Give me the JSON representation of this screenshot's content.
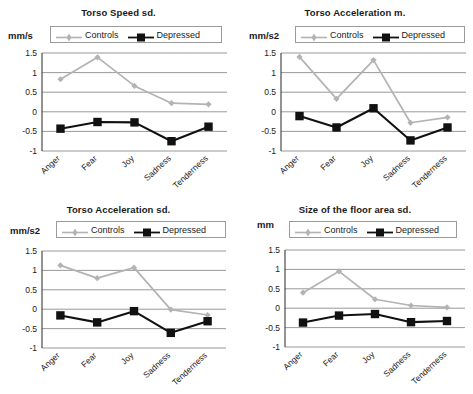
{
  "figure": {
    "series_names": [
      "Controls",
      "Depressed"
    ],
    "categories": [
      "Anger",
      "Fear",
      "Joy",
      "Sadness",
      "Tenderness"
    ],
    "yticks": [
      "1.5",
      "1",
      "0.5",
      "0",
      "-0.5",
      "-1"
    ],
    "colors": {
      "controls": "#b3b3b3",
      "depressed": "#111111",
      "grid": "#8d8d8d",
      "axis": "#3a3a3a"
    }
  },
  "chart_data": [
    {
      "type": "line",
      "title": "Torso Speed sd.",
      "ylabel": "mm/s",
      "xlabel": "",
      "categories": [
        "Anger",
        "Fear",
        "Joy",
        "Sadness",
        "Tenderness"
      ],
      "ylim": [
        -1,
        1.5
      ],
      "yticks": [
        1.5,
        1,
        0.5,
        0,
        -0.5,
        -1
      ],
      "grid": true,
      "legend": "top",
      "series": [
        {
          "name": "Controls",
          "values": [
            0.83,
            1.39,
            0.66,
            0.22,
            0.19
          ]
        },
        {
          "name": "Depressed",
          "values": [
            -0.43,
            -0.26,
            -0.27,
            -0.75,
            -0.38
          ]
        }
      ]
    },
    {
      "type": "line",
      "title": "Torso Acceleration m.",
      "ylabel": "mm/s2",
      "xlabel": "",
      "categories": [
        "Anger",
        "Fear",
        "Joy",
        "Sadness",
        "Tenderness"
      ],
      "ylim": [
        -1,
        1.5
      ],
      "yticks": [
        1.5,
        1,
        0.5,
        0,
        -0.5,
        -1
      ],
      "grid": true,
      "legend": "top",
      "series": [
        {
          "name": "Controls",
          "values": [
            1.4,
            0.33,
            1.32,
            -0.28,
            -0.14
          ]
        },
        {
          "name": "Depressed",
          "values": [
            -0.11,
            -0.4,
            0.09,
            -0.73,
            -0.4
          ]
        }
      ]
    },
    {
      "type": "line",
      "title": "Torso Acceleration sd.",
      "ylabel": "mm/s2",
      "xlabel": "",
      "categories": [
        "Anger",
        "Fear",
        "Joy",
        "Sadness",
        "Tenderness"
      ],
      "ylim": [
        -1,
        1.5
      ],
      "yticks": [
        1.5,
        1,
        0.5,
        0,
        -0.5,
        -1
      ],
      "grid": true,
      "legend": "top",
      "series": [
        {
          "name": "Controls",
          "values": [
            1.13,
            0.8,
            1.07,
            -0.01,
            -0.15
          ]
        },
        {
          "name": "Depressed",
          "values": [
            -0.16,
            -0.34,
            -0.05,
            -0.61,
            -0.31
          ]
        }
      ]
    },
    {
      "type": "line",
      "title": "Size of the floor area sd.",
      "ylabel": "mm",
      "xlabel": "",
      "categories": [
        "Anger",
        "Fear",
        "Joy",
        "Sadness",
        "Tenderness"
      ],
      "ylim": [
        -1,
        1.5
      ],
      "yticks": [
        1.5,
        1,
        0.5,
        0,
        -0.5,
        -1
      ],
      "grid": true,
      "legend": "top",
      "series": [
        {
          "name": "Controls",
          "values": [
            0.4,
            0.95,
            0.23,
            0.07,
            0.02
          ]
        },
        {
          "name": "Depressed",
          "values": [
            -0.37,
            -0.19,
            -0.15,
            -0.36,
            -0.33
          ]
        }
      ]
    }
  ]
}
